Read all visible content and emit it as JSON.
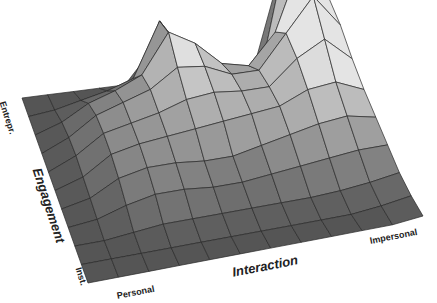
{
  "chart_data": {
    "type": "surface3d",
    "title": "",
    "xlabel": "Interaction",
    "ylabel": "Engagement",
    "x_ticks": [
      "Personal",
      "Impersonal"
    ],
    "y_ticks": [
      "Inst.",
      "Entrepr."
    ],
    "grid_rows": 11,
    "grid_cols": 12,
    "note": "Relative surface heights (0-1) estimated from shaded mesh; rows run from Inst. (front) to Entrepr. (back), columns from Personal (left) to Impersonal (right).",
    "z": [
      [
        0,
        0,
        0,
        0,
        0,
        0,
        0,
        0,
        0,
        0,
        0,
        0.02
      ],
      [
        0,
        0,
        0,
        0,
        0,
        0,
        0,
        0,
        0,
        0,
        0.02,
        0.05
      ],
      [
        0,
        0,
        0.02,
        0.04,
        0.04,
        0.04,
        0.04,
        0.04,
        0.04,
        0.05,
        0.07,
        0.1
      ],
      [
        0,
        0.02,
        0.08,
        0.12,
        0.12,
        0.1,
        0.1,
        0.12,
        0.14,
        0.16,
        0.18,
        0.18
      ],
      [
        0,
        0.04,
        0.14,
        0.18,
        0.18,
        0.16,
        0.16,
        0.2,
        0.24,
        0.28,
        0.3,
        0.26
      ],
      [
        0,
        0.06,
        0.18,
        0.22,
        0.24,
        0.26,
        0.28,
        0.3,
        0.32,
        0.4,
        0.42,
        0.34
      ],
      [
        0,
        0.08,
        0.2,
        0.24,
        0.28,
        0.34,
        0.36,
        0.34,
        0.34,
        0.5,
        0.6,
        0.44
      ],
      [
        0,
        0.08,
        0.2,
        0.26,
        0.32,
        0.44,
        0.42,
        0.34,
        0.34,
        0.56,
        0.78,
        0.56
      ],
      [
        0,
        0.06,
        0.16,
        0.22,
        0.3,
        0.56,
        0.46,
        0.3,
        0.26,
        0.46,
        0.92,
        0.64
      ],
      [
        0,
        0.02,
        0.06,
        0.1,
        0.16,
        0.52,
        0.26,
        0.1,
        0.08,
        0.2,
        1.0,
        0.3
      ],
      [
        0,
        0,
        0,
        0,
        0,
        0.2,
        0.04,
        0,
        0,
        0,
        0.6,
        0
      ]
    ],
    "colors": {
      "base": "#555555",
      "peak": "#dcdcdc",
      "mesh_line": "#2a2a2a"
    }
  },
  "labels": {
    "y_tick_back": "Entrepr.",
    "y_tick_front": "Inst.",
    "y_axis": "Engagement",
    "x_tick_left": "Personal",
    "x_tick_right": "Impersonal",
    "x_axis": "Interaction"
  }
}
